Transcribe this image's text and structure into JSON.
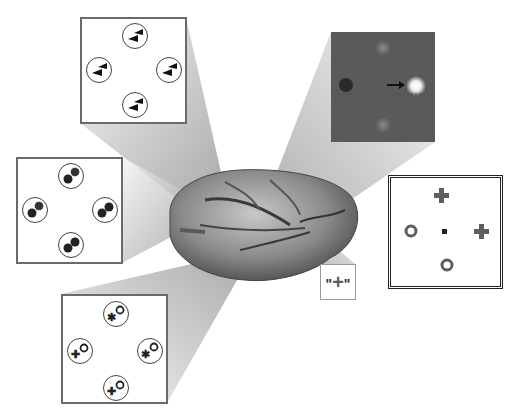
{
  "figure": {
    "colors": {
      "panel_border": "#6a6a6a",
      "dark_panel_bg": "#5a5a5a",
      "symbol_gray": "#5e5e5e",
      "brain_base": "#8a8a8a"
    }
  },
  "panels": {
    "top_left": {
      "name": "oriented-bars-panel",
      "items": [
        "bars-top",
        "bars-left",
        "bars-right",
        "bars-bottom"
      ]
    },
    "left": {
      "name": "dots-panel",
      "items": [
        "dots-top",
        "dots-left",
        "dots-right",
        "dots-bottom"
      ]
    },
    "bottom": {
      "name": "mixed-symbols-panel",
      "items": [
        "mixed-top",
        "mixed-left",
        "mixed-right",
        "mixed-bottom"
      ]
    },
    "dark": {
      "name": "saccade-target-panel",
      "arrow_direction": "right"
    },
    "right": {
      "name": "symbol-array-panel",
      "symbols": [
        "plus",
        "circle",
        "fixation",
        "plus",
        "circle"
      ]
    },
    "quote": {
      "name": "quoted-plus-label",
      "text_left": "\"",
      "symbol": "+",
      "text_right": "\""
    }
  }
}
